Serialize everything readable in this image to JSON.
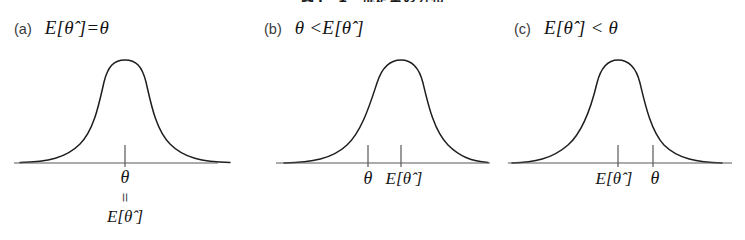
{
  "figure": {
    "caption": "図4・1　推定量の分布",
    "line_color": "#1e1e1e",
    "axis_color": "#4a4a4a",
    "background": "#ffffff"
  },
  "panels": [
    {
      "id": "a",
      "tag": "(a)",
      "expression": "E[θ̂ ]=θ",
      "curve_peak_x": 125,
      "ticks": [
        {
          "x": 125,
          "label": ""
        }
      ],
      "stacked_label": {
        "top": "θ",
        "middle": "=",
        "bottom": "E[θ̂ ]"
      }
    },
    {
      "id": "b",
      "tag": "(b)",
      "expression": "θ <E[θ̂ ]",
      "curve_peak_x": 400,
      "ticks": [
        {
          "x": 368,
          "label": "θ"
        },
        {
          "x": 401,
          "label": "E[θ̂ ]"
        }
      ],
      "stacked_label": null
    },
    {
      "id": "c",
      "tag": "(c)",
      "expression": "E[θ̂ ] < θ",
      "curve_peak_x": 618,
      "ticks": [
        {
          "x": 618,
          "label": "E[θ̂ ]"
        },
        {
          "x": 653,
          "label": "θ"
        }
      ],
      "stacked_label": null
    }
  ]
}
